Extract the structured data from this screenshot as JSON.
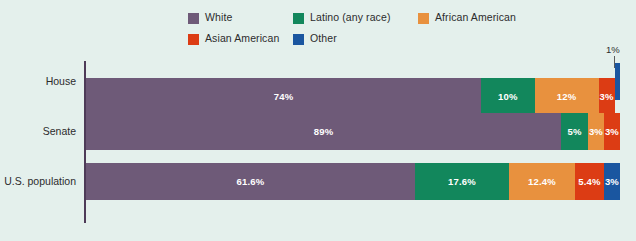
{
  "chart_data": {
    "type": "bar",
    "orientation": "horizontal",
    "stacked": true,
    "normalized": true,
    "title": "",
    "xlabel": "",
    "ylabel": "",
    "xlim": [
      0,
      100
    ],
    "grid": false,
    "legend_position": "top",
    "background_color": "#e4f0ec",
    "axis_color": "#4e3b58",
    "categories": [
      "House",
      "Senate",
      "U.S. population"
    ],
    "series": [
      {
        "name": "White",
        "color": "#6e5a78",
        "values": [
          74,
          89,
          61.6
        ],
        "labels": [
          "74%",
          "89%",
          "61.6%"
        ]
      },
      {
        "name": "Latino (any race)",
        "color": "#12875c",
        "values": [
          10,
          5,
          17.6
        ],
        "labels": [
          "10%",
          "5%",
          "17.6%"
        ]
      },
      {
        "name": "African American",
        "color": "#e8913e",
        "values": [
          12,
          3,
          12.4
        ],
        "labels": [
          "12%",
          "3%",
          "12.4%"
        ]
      },
      {
        "name": "Asian American",
        "color": "#dc3c14",
        "values": [
          3,
          3,
          5.4
        ],
        "labels": [
          "3%",
          "3%",
          "5.4%"
        ]
      },
      {
        "name": "Other",
        "color": "#1a56a0",
        "values": [
          1,
          0,
          3
        ],
        "labels": [
          "1%",
          "",
          "3%"
        ]
      }
    ],
    "annotations": [
      {
        "text": "1%",
        "points_to": "House / Other segment",
        "position": "above-right"
      }
    ]
  },
  "legend": {
    "row1": [
      {
        "label": "White",
        "color": "#6e5a78"
      },
      {
        "label": "Latino (any race)",
        "color": "#12875c"
      },
      {
        "label": "African American",
        "color": "#e8913e"
      }
    ],
    "row2": [
      {
        "label": "Asian American",
        "color": "#dc3c14"
      },
      {
        "label": "Other",
        "color": "#1a56a0"
      }
    ]
  },
  "rows": [
    {
      "label": "House",
      "segments": [
        {
          "series": "White",
          "value": 74,
          "label": "74%",
          "color": "#6e5a78",
          "show_label": true
        },
        {
          "series": "Latino (any race)",
          "value": 10,
          "label": "10%",
          "color": "#12875c",
          "show_label": true
        },
        {
          "series": "African American",
          "value": 12,
          "label": "12%",
          "color": "#e8913e",
          "show_label": true
        },
        {
          "series": "Asian American",
          "value": 3,
          "label": "3%",
          "color": "#dc3c14",
          "show_label": true
        },
        {
          "series": "Other",
          "value": 1,
          "label": "1%",
          "color": "#1a56a0",
          "show_label": false
        }
      ]
    },
    {
      "label": "Senate",
      "segments": [
        {
          "series": "White",
          "value": 89,
          "label": "89%",
          "color": "#6e5a78",
          "show_label": true
        },
        {
          "series": "Latino (any race)",
          "value": 5,
          "label": "5%",
          "color": "#12875c",
          "show_label": true
        },
        {
          "series": "African American",
          "value": 3,
          "label": "3%",
          "color": "#e8913e",
          "show_label": true
        },
        {
          "series": "Asian American",
          "value": 3,
          "label": "3%",
          "color": "#dc3c14",
          "show_label": true
        }
      ]
    },
    {
      "label": "U.S. population",
      "segments": [
        {
          "series": "White",
          "value": 61.6,
          "label": "61.6%",
          "color": "#6e5a78",
          "show_label": true
        },
        {
          "series": "Latino (any race)",
          "value": 17.6,
          "label": "17.6%",
          "color": "#12875c",
          "show_label": true
        },
        {
          "series": "African American",
          "value": 12.4,
          "label": "12.4%",
          "color": "#e8913e",
          "show_label": true
        },
        {
          "series": "Asian American",
          "value": 5.4,
          "label": "5.4%",
          "color": "#dc3c14",
          "show_label": true
        },
        {
          "series": "Other",
          "value": 3,
          "label": "3%",
          "color": "#1a56a0",
          "show_label": true
        }
      ]
    }
  ],
  "callout": {
    "text": "1%"
  }
}
